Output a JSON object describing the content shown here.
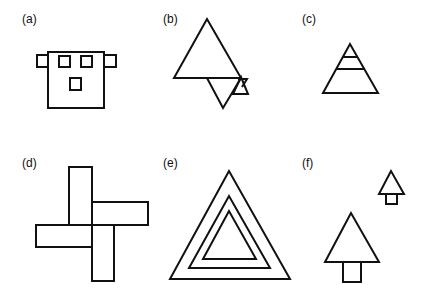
{
  "figure": {
    "panels": [
      {
        "id": "a",
        "label": "(a)",
        "description": "Square face with two side tabs, two upper square eyes and one lower square"
      },
      {
        "id": "b",
        "label": "(b)",
        "description": "Large upright triangle overlapped by an inverted triangle and a small triangle at the base right"
      },
      {
        "id": "c",
        "label": "(c)",
        "description": "Triangle divided by two horizontal lines near its apex"
      },
      {
        "id": "d",
        "label": "(d)",
        "description": "Four rectangles arranged in a pinwheel/cross"
      },
      {
        "id": "e",
        "label": "(e)",
        "description": "Three nested triangles"
      },
      {
        "id": "f",
        "label": "(f)",
        "description": "Two tree shapes (triangle on square trunk), one large and one small"
      }
    ],
    "stroke_color": "#111111",
    "background": "#ffffff"
  }
}
